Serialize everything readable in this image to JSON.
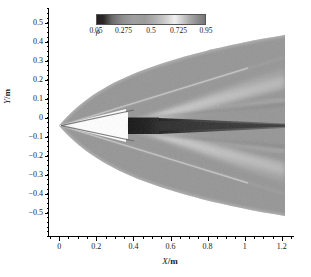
{
  "figure": {
    "type": "density-contour-flowfield",
    "background": "#ffffff"
  },
  "axes": {
    "x": {
      "title_sym": "X",
      "title_unit": "/m",
      "min": -0.06,
      "max": 1.26,
      "ticks": [
        {
          "value": 0,
          "label": "0"
        },
        {
          "value": 0.2,
          "label": "0.2"
        },
        {
          "value": 0.4,
          "label": "0.4"
        },
        {
          "value": 0.6,
          "label": "0.6"
        },
        {
          "value": 0.8,
          "label": "0.8"
        },
        {
          "value": 1.0,
          "label": "1"
        },
        {
          "value": 1.2,
          "label": "1.2"
        }
      ],
      "minor_step": 0.05
    },
    "y": {
      "title_sym": "Y",
      "title_unit": "/m",
      "min": -0.62,
      "max": 0.58,
      "ticks": [
        {
          "value": 0.5,
          "label": "0.5"
        },
        {
          "value": 0.4,
          "label": "0.4"
        },
        {
          "value": 0.3,
          "label": "0.3"
        },
        {
          "value": 0.2,
          "label": "0.2"
        },
        {
          "value": 0.1,
          "label": "0.1"
        },
        {
          "value": 0.0,
          "label": "0"
        },
        {
          "value": -0.1,
          "label": "−0.1"
        },
        {
          "value": -0.2,
          "label": "−0.2"
        },
        {
          "value": -0.3,
          "label": "−0.3"
        },
        {
          "value": -0.4,
          "label": "−0.4"
        },
        {
          "value": -0.5,
          "label": "−0.5"
        }
      ],
      "minor_step": 0.025
    }
  },
  "colorbar": {
    "symbol": "ρ",
    "orientation": "horizontal",
    "ticks": [
      {
        "value": 0.05,
        "label": "0.05"
      },
      {
        "value": 0.275,
        "label": "0.275"
      },
      {
        "value": 0.5,
        "label": "0.5"
      },
      {
        "value": 0.725,
        "label": "0.725"
      },
      {
        "value": 0.95,
        "label": "0.95"
      }
    ],
    "vmin": 0.05,
    "vmax": 0.95,
    "colormap": "grayscale-banded",
    "stops": [
      {
        "pos": 0.0,
        "color": "#231f1f"
      },
      {
        "pos": 0.06,
        "color": "#2c2828"
      },
      {
        "pos": 0.14,
        "color": "#6a6a6a"
      },
      {
        "pos": 0.24,
        "color": "#8f8f8f"
      },
      {
        "pos": 0.34,
        "color": "#a0a0a0"
      },
      {
        "pos": 0.44,
        "color": "#9a9a9a"
      },
      {
        "pos": 0.54,
        "color": "#b0b0b0"
      },
      {
        "pos": 0.64,
        "color": "#cfcfcf"
      },
      {
        "pos": 0.72,
        "color": "#efefef"
      },
      {
        "pos": 0.78,
        "color": "#d2d2d2"
      },
      {
        "pos": 0.86,
        "color": "#a8a8a8"
      },
      {
        "pos": 0.94,
        "color": "#8a8a8a"
      },
      {
        "pos": 1.0,
        "color": "#777777"
      }
    ]
  },
  "chart_data": {
    "type": "heatmap",
    "title": "",
    "xlabel": "X/m",
    "ylabel": "Y/m",
    "xlim": [
      -0.06,
      1.26
    ],
    "ylim": [
      -0.62,
      0.58
    ],
    "colorbar_label": "ρ",
    "clim": [
      0.05,
      0.95
    ],
    "grid": false,
    "legend": "none",
    "features": [
      {
        "name": "bow-shock-envelope",
        "shape": "parabola",
        "apex": [
          0.0,
          0.0
        ],
        "half_width_at_x": [
          {
            "x": 0.0,
            "y": 0.0
          },
          {
            "x": 0.05,
            "y": 0.125
          },
          {
            "x": 0.1,
            "y": 0.175
          },
          {
            "x": 0.2,
            "y": 0.245
          },
          {
            "x": 0.4,
            "y": 0.335
          },
          {
            "x": 0.6,
            "y": 0.405
          },
          {
            "x": 0.8,
            "y": 0.462
          },
          {
            "x": 1.0,
            "y": 0.512
          },
          {
            "x": 1.2,
            "y": 0.557
          }
        ],
        "density_inside": 0.5
      },
      {
        "name": "nose-expansion-wedge",
        "shape": "triangle-low-density",
        "apex": [
          0.0,
          0.0
        ],
        "x_extent": [
          0.0,
          0.36
        ],
        "half_angle_deg": 9.5,
        "density": 0.95
      },
      {
        "name": "body",
        "shape": "rectangle-dark",
        "x_extent": [
          0.355,
          0.52
        ],
        "y_extent": [
          -0.045,
          0.045
        ],
        "density": 0.06
      },
      {
        "name": "wake-core",
        "shape": "tapered-dark-streak",
        "x_extent": [
          0.52,
          1.2
        ],
        "y_half_width_start": 0.045,
        "y_half_width_end": 0.012,
        "density": 0.3
      },
      {
        "name": "expansion-fan-upper",
        "shape": "bright-band",
        "from": [
          0.36,
          0.0
        ],
        "to": [
          1.2,
          0.3
        ],
        "density": 0.72
      },
      {
        "name": "expansion-fan-lower",
        "shape": "bright-band",
        "from": [
          0.36,
          0.0
        ],
        "to": [
          1.2,
          -0.3
        ],
        "density": 0.72
      },
      {
        "name": "secondary-shear-upper",
        "shape": "bright-band",
        "from": [
          0.52,
          0.045
        ],
        "to": [
          1.2,
          0.17
        ],
        "density": 0.66
      },
      {
        "name": "secondary-shear-lower",
        "shape": "bright-band",
        "from": [
          0.52,
          -0.045
        ],
        "to": [
          1.2,
          -0.17
        ],
        "density": 0.66
      }
    ],
    "freestream_density": 0.5
  }
}
